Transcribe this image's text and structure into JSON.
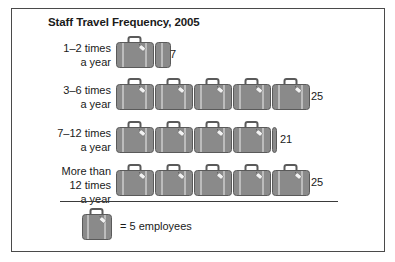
{
  "chart_data": {
    "type": "pictograph",
    "title": "Staff Travel Frequency, 2005",
    "unit_icon": "suitcase-icon",
    "unit_value": 5,
    "unit_label": "employees",
    "categories": [
      "1–2 times a year",
      "3–6 times a year",
      "7–12 times a year",
      "More than 12 times a year"
    ],
    "values": [
      7,
      25,
      21,
      25
    ],
    "icons_per_row": [
      1.4,
      5,
      4.2,
      5
    ],
    "legend": "= 5 employees",
    "colors": {
      "suitcase_fill": "#8a8a8a",
      "suitcase_stroke": "#5a5a5a",
      "strap": "#d8d8d8",
      "tag": "#f2f2f2"
    }
  },
  "title": "Staff Travel Frequency, 2005",
  "rows": [
    {
      "label_lines": [
        "1–2 times",
        "a year"
      ],
      "value": "7"
    },
    {
      "label_lines": [
        "3–6 times",
        "a year"
      ],
      "value": "25"
    },
    {
      "label_lines": [
        "7–12 times",
        "a year"
      ],
      "value": "21"
    },
    {
      "label_lines": [
        "More than",
        "12 times",
        "a year"
      ],
      "value": "25"
    }
  ],
  "legend": {
    "icon": "suitcase-icon",
    "text": "= 5 employees"
  }
}
